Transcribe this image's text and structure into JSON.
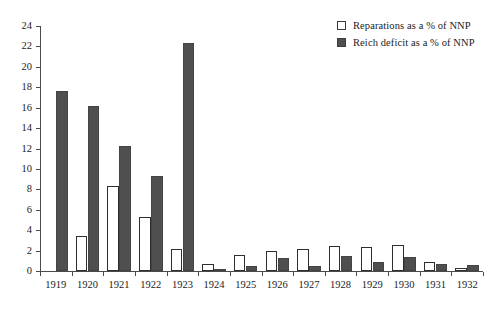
{
  "chart_data": {
    "type": "bar",
    "title": "",
    "xlabel": "",
    "ylabel": "",
    "ylim": [
      0,
      24
    ],
    "ytick_step": 2,
    "yticks": [
      0,
      2,
      4,
      6,
      8,
      10,
      12,
      14,
      16,
      18,
      20,
      22,
      24
    ],
    "grid": false,
    "legend_position": "top-right",
    "categories": [
      "1919",
      "1920",
      "1921",
      "1922",
      "1923",
      "1924",
      "1925",
      "1926",
      "1927",
      "1928",
      "1929",
      "1930",
      "1931",
      "1932"
    ],
    "series": [
      {
        "name": "Reparations as a % of NNP",
        "color": "#ffffff",
        "edge_color": "#2e2e2e",
        "values": [
          0,
          3.4,
          8.35,
          5.3,
          2.2,
          0.65,
          1.6,
          2.0,
          2.2,
          2.45,
          2.4,
          2.5,
          0.85,
          0.3
        ]
      },
      {
        "name": "Reich deficit as a % of NNP",
        "color": "#4f4f4f",
        "edge_color": "#444444",
        "values": [
          17.65,
          16.2,
          12.2,
          9.3,
          22.3,
          0.15,
          0.45,
          1.3,
          0.5,
          1.5,
          0.85,
          1.35,
          0.65,
          0.6
        ]
      }
    ]
  },
  "legend": {
    "items": [
      {
        "label": "Reparations as a % of NNP",
        "swatch": "open-square"
      },
      {
        "label": "Reich deficit as a % of NNP",
        "swatch": "filled-square"
      }
    ]
  },
  "colors": {
    "bar_open_fill": "#ffffff",
    "bar_filled_fill": "#4f4f4f",
    "axis": "#4a4a4a",
    "text": "#1b1b1b",
    "background": "#ffffff"
  }
}
